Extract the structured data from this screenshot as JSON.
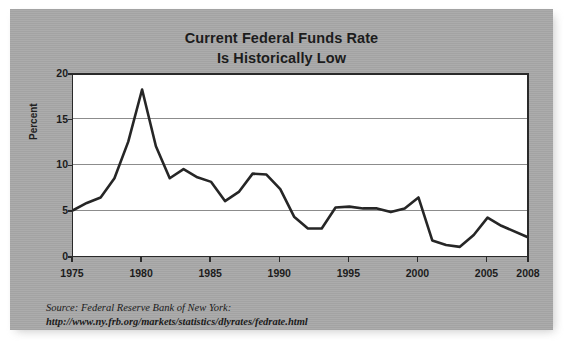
{
  "chart_data": {
    "type": "line",
    "title": "Current Federal Funds Rate Is Historically Low",
    "title_lines": [
      "Current Federal Funds Rate",
      "Is Historically Low"
    ],
    "xlabel": "",
    "ylabel": "Percent",
    "xlim": [
      1975,
      2008
    ],
    "ylim": [
      0,
      20
    ],
    "grid": "horizontal",
    "legend": "none",
    "x_tick_labels": [
      "1975",
      "1980",
      "1985",
      "1990",
      "1995",
      "2000",
      "2005",
      "2008"
    ],
    "x_ticks": [
      1975,
      1980,
      1985,
      1990,
      1995,
      2000,
      2005,
      2008
    ],
    "y_tick_labels": [
      "0",
      "5",
      "10",
      "15",
      "20"
    ],
    "y_ticks": [
      0,
      5,
      10,
      15,
      20
    ],
    "series": [
      {
        "name": "Federal Funds Rate",
        "color": "#262626",
        "x": [
          1975,
          1976,
          1977,
          1978,
          1979,
          1980,
          1981,
          1982,
          1983,
          1984,
          1985,
          1986,
          1987,
          1988,
          1989,
          1990,
          1991,
          1992,
          1993,
          1994,
          1995,
          1996,
          1997,
          1998,
          1999,
          2000,
          2001,
          2002,
          2003,
          2004,
          2005,
          2006,
          2008
        ],
        "values": [
          5.0,
          5.8,
          6.4,
          8.5,
          12.5,
          18.2,
          12.0,
          8.5,
          9.5,
          8.6,
          8.1,
          6.0,
          7.0,
          9.0,
          8.9,
          7.3,
          4.3,
          3.0,
          3.0,
          5.3,
          5.4,
          5.2,
          5.2,
          4.8,
          5.2,
          6.4,
          1.7,
          1.2,
          1.0,
          2.3,
          4.2,
          3.3,
          2.0
        ]
      }
    ],
    "source": {
      "label": "Source: Federal Reserve Bank of New York:",
      "url": "http://www.ny.frb.org/markets/statistics/dlyrates/fedrate.html"
    },
    "colors": {
      "panel_background": "#a8a8a8",
      "plot_background": "#ffffff",
      "line": "#262626",
      "gridline": "#8c8c8c",
      "axis": "#2a2a2a",
      "text": "#1c1c1c"
    }
  }
}
